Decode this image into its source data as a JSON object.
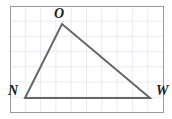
{
  "figure": {
    "kind": "geometry-diagram",
    "shape_name": "triangle",
    "canvas": {
      "width": 172,
      "height": 119,
      "background": "#ffffff"
    },
    "frame": {
      "name": "plot-frame",
      "x": 10,
      "y": 6,
      "width": 153,
      "height": 106,
      "stroke": "#9a9a9a",
      "stroke_width": 1,
      "fill": "#ffffff"
    },
    "grid": {
      "visible": true,
      "spacing": 15.3,
      "color": "#e6ecf2",
      "stroke_width": 1,
      "vertical_x": [
        25.3,
        40.6,
        55.9,
        71.2,
        86.5,
        101.8,
        117.1,
        132.4,
        147.7
      ],
      "horizontal_y": [
        21.2,
        36.4,
        51.6,
        66.8,
        82.0,
        97.2
      ]
    },
    "triangle": {
      "name": "triangle-now",
      "stroke": "#666666",
      "stroke_width": 2,
      "fill": "none",
      "points": "25,98 62,24 150,98",
      "vertices": [
        {
          "id": "N",
          "label": "N",
          "x": 25,
          "y": 98,
          "label_x": 18,
          "label_y": 95,
          "anchor": "end"
        },
        {
          "id": "O",
          "label": "O",
          "x": 62,
          "y": 24,
          "label_x": 59,
          "label_y": 18,
          "anchor": "middle"
        },
        {
          "id": "W",
          "label": "W",
          "x": 150,
          "y": 98,
          "label_x": 156,
          "label_y": 95,
          "anchor": "start"
        }
      ],
      "sides": [
        {
          "id": "NO",
          "from": "N",
          "to": "O"
        },
        {
          "id": "OW",
          "from": "O",
          "to": "W"
        },
        {
          "id": "WN",
          "from": "W",
          "to": "N"
        }
      ]
    },
    "labels": {
      "apex": "O",
      "bottom_left": "N",
      "bottom_right": "W"
    }
  }
}
